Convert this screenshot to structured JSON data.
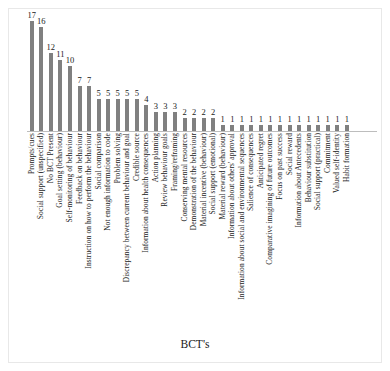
{
  "chart_data": {
    "type": "bar",
    "title": "",
    "xlabel": "BCT's",
    "ylabel": "Frequency",
    "grid": false,
    "legend": false,
    "ylim": [
      0,
      18
    ],
    "bar_color": "#808080",
    "categories": [
      "Prompts/cues",
      "Social support (unspecified)",
      "No BCT Present",
      "Goal setting (behaviour)",
      "Self-monitoring of behaviour",
      "Feedback on behaviour",
      "Instruction on how to perform the behaviour",
      "Social comparison",
      "Not enough information to code",
      "Problem solving",
      "Discrepancy between current behaviour and goal",
      "Credible source",
      "Information about health consequences",
      "Action planning",
      "Review behaviour goals",
      "Framing/reframing",
      "Conserving mental resources",
      "Demonstration of the behaviour",
      "Material incentive (behaviour)",
      "Social support (emotional)",
      "Material reward (behaviour)",
      "Information about others' approval",
      "Information about social and environmental sequences",
      "Salience of consequences",
      "Anticipated regret",
      "Comparative imagining of future outcomes",
      "Focus on past success",
      "Social reward",
      "Information about Antecedents",
      "Behaviour substitution",
      "Social support (practical)",
      "Commitment",
      "Valued self-identity",
      "Habit formation"
    ],
    "values": [
      17,
      16,
      12,
      11,
      10,
      7,
      7,
      5,
      5,
      5,
      5,
      5,
      4,
      3,
      3,
      3,
      2,
      2,
      2,
      2,
      1,
      1,
      1,
      1,
      1,
      1,
      1,
      1,
      1,
      1,
      1,
      1,
      1,
      1
    ]
  }
}
